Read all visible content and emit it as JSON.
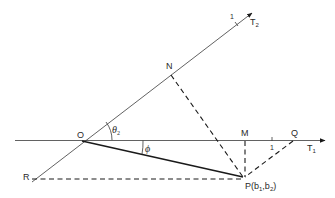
{
  "diagram": {
    "points": {
      "O": {
        "label": "O"
      },
      "N": {
        "label": "N"
      },
      "M": {
        "label": "M"
      },
      "Q": {
        "label": "Q"
      },
      "R": {
        "label": "R"
      },
      "P": {
        "label": "P(b",
        "sub1": "1",
        "mid": ",b",
        "sub2": "2",
        "end": ")"
      }
    },
    "axes": {
      "T1": {
        "label": "T",
        "sub": "1",
        "tick_label": "1"
      },
      "T2": {
        "label": "T",
        "sub": "2",
        "tick_label": "1"
      }
    },
    "angles": {
      "theta": {
        "label": "θ",
        "sub": "2"
      },
      "phi": {
        "label": "ϕ"
      }
    },
    "colors": {
      "line": "#1a1a1a",
      "background": "#ffffff"
    }
  }
}
